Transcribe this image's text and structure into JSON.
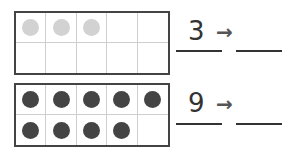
{
  "colors": {
    "filled_light": "#d2d2d2",
    "filled_dark": "#444444",
    "empty": "transparent"
  },
  "rows": [
    {
      "cells": [
        "light",
        "light",
        "light",
        "empty",
        "empty",
        "empty",
        "empty",
        "empty",
        "empty",
        "empty"
      ],
      "number": "3",
      "arrow": "→",
      "answer": ""
    },
    {
      "cells": [
        "dark",
        "dark",
        "dark",
        "dark",
        "dark",
        "dark",
        "dark",
        "dark",
        "dark",
        "empty"
      ],
      "number": "9",
      "arrow": "→",
      "answer": ""
    }
  ]
}
